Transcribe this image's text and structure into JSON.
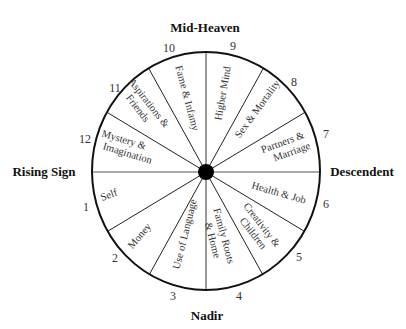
{
  "cardinals": {
    "top": "Mid-Heaven",
    "bottom": "Nadir",
    "left": "Rising Sign",
    "right": "Descendent"
  },
  "houses": [
    {
      "number": "1",
      "label": [
        "Self"
      ]
    },
    {
      "number": "2",
      "label": [
        "Money"
      ]
    },
    {
      "number": "3",
      "label": [
        "Use of Language"
      ]
    },
    {
      "number": "4",
      "label": [
        "Family Roots",
        "& Home"
      ]
    },
    {
      "number": "5",
      "label": [
        "Creativity &",
        "Children"
      ]
    },
    {
      "number": "6",
      "label": [
        "Health & Job"
      ]
    },
    {
      "number": "7",
      "label": [
        "Partners &",
        "Marriage"
      ]
    },
    {
      "number": "8",
      "label": [
        "Sex & Mortality"
      ]
    },
    {
      "number": "9",
      "label": [
        "Higher Mind"
      ]
    },
    {
      "number": "10",
      "label": [
        "Fame & Infamy"
      ]
    },
    {
      "number": "11",
      "label": [
        "Aspirations &",
        "Friends"
      ]
    },
    {
      "number": "12",
      "label": [
        "Mystery &",
        "Imagination"
      ]
    }
  ],
  "colors": {
    "line": "#111111",
    "text": "#333333",
    "center_dot": "#000000"
  }
}
